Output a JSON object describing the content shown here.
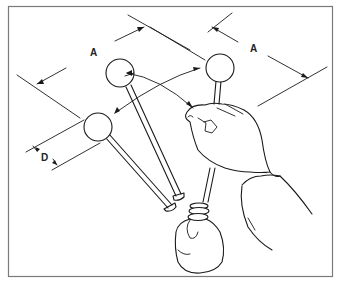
{
  "diagram": {
    "labels": {
      "dimension_a_left": "A",
      "dimension_a_right": "A",
      "dimension_d": "D"
    },
    "parts": [
      {
        "name": "shift-lever-ball-left-top",
        "type": "lever with ball knob"
      },
      {
        "name": "shift-lever-ball-lower-left",
        "type": "lever with ball knob"
      },
      {
        "name": "shift-lever-ball-right",
        "type": "lever with ball knob held by hand"
      },
      {
        "name": "hand",
        "type": "hand gripping lever"
      },
      {
        "name": "lever-boot",
        "type": "rubber boot at lever base"
      }
    ],
    "colors": {
      "line": "#1a1a1a",
      "border": "#7a7a7a",
      "background": "#ffffff"
    }
  }
}
